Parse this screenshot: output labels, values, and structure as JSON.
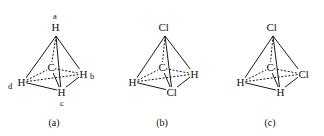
{
  "figure": {
    "background_color": "#ffffff",
    "bond_color": "#1a1a1a",
    "text_color": "#111111"
  },
  "structures": [
    {
      "caption": "(a)",
      "center_atom": "C",
      "vertices": {
        "top": "H",
        "left": "H",
        "right": "H",
        "bottom": "H"
      },
      "position_labels": {
        "top": "a",
        "right": "b",
        "bottom": "c",
        "left": "d"
      }
    },
    {
      "caption": "(b)",
      "center_atom": "C",
      "vertices": {
        "top": "Cl",
        "left": "H",
        "right": "H",
        "bottom": "Cl"
      },
      "position_labels": {
        "top": "",
        "right": "",
        "bottom": "",
        "left": ""
      }
    },
    {
      "caption": "(c)",
      "center_atom": "C",
      "vertices": {
        "top": "Cl",
        "left": "H",
        "right": "Cl",
        "bottom": "H"
      },
      "position_labels": {
        "top": "",
        "right": "",
        "bottom": "",
        "left": ""
      }
    }
  ]
}
